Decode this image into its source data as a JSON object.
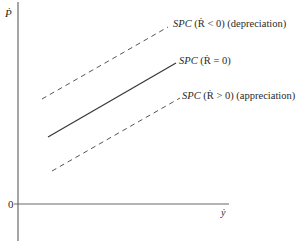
{
  "diagram": {
    "y_axis_label": "Ṗ",
    "x_axis_label": "ẏ",
    "origin_label": "0",
    "curves": [
      {
        "id": "depreciation",
        "style": "dashed",
        "label_main": "SPC",
        "label_cond": "(Ṙ < 0)",
        "label_note": "(depreciation)"
      },
      {
        "id": "neutral",
        "style": "solid",
        "label_main": "SPC",
        "label_cond": "(Ṙ = 0)",
        "label_note": ""
      },
      {
        "id": "appreciation",
        "style": "dashed",
        "label_main": "SPC",
        "label_cond": "(Ṙ > 0)",
        "label_note": "(appreciation)"
      }
    ],
    "colors": {
      "axis": "#6a6a6a",
      "line": "#3a3a3a",
      "dash": "#555555"
    }
  }
}
